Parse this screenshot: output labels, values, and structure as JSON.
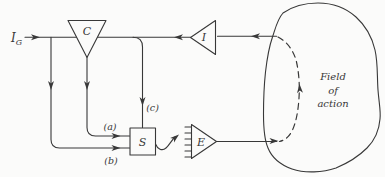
{
  "colors": {
    "paper": "#fbfbfa",
    "ink": "#383838"
  },
  "diagram": {
    "goal_input": {
      "main": "I",
      "sub": "G"
    },
    "nodes": {
      "comparator": "C",
      "indicator": "I",
      "selector": "S",
      "effector": "E"
    },
    "paths": {
      "a": "(a)",
      "b": "(b)",
      "c": "(c)"
    },
    "field": {
      "line1": "Field",
      "line2": "of",
      "line3": "action"
    }
  }
}
